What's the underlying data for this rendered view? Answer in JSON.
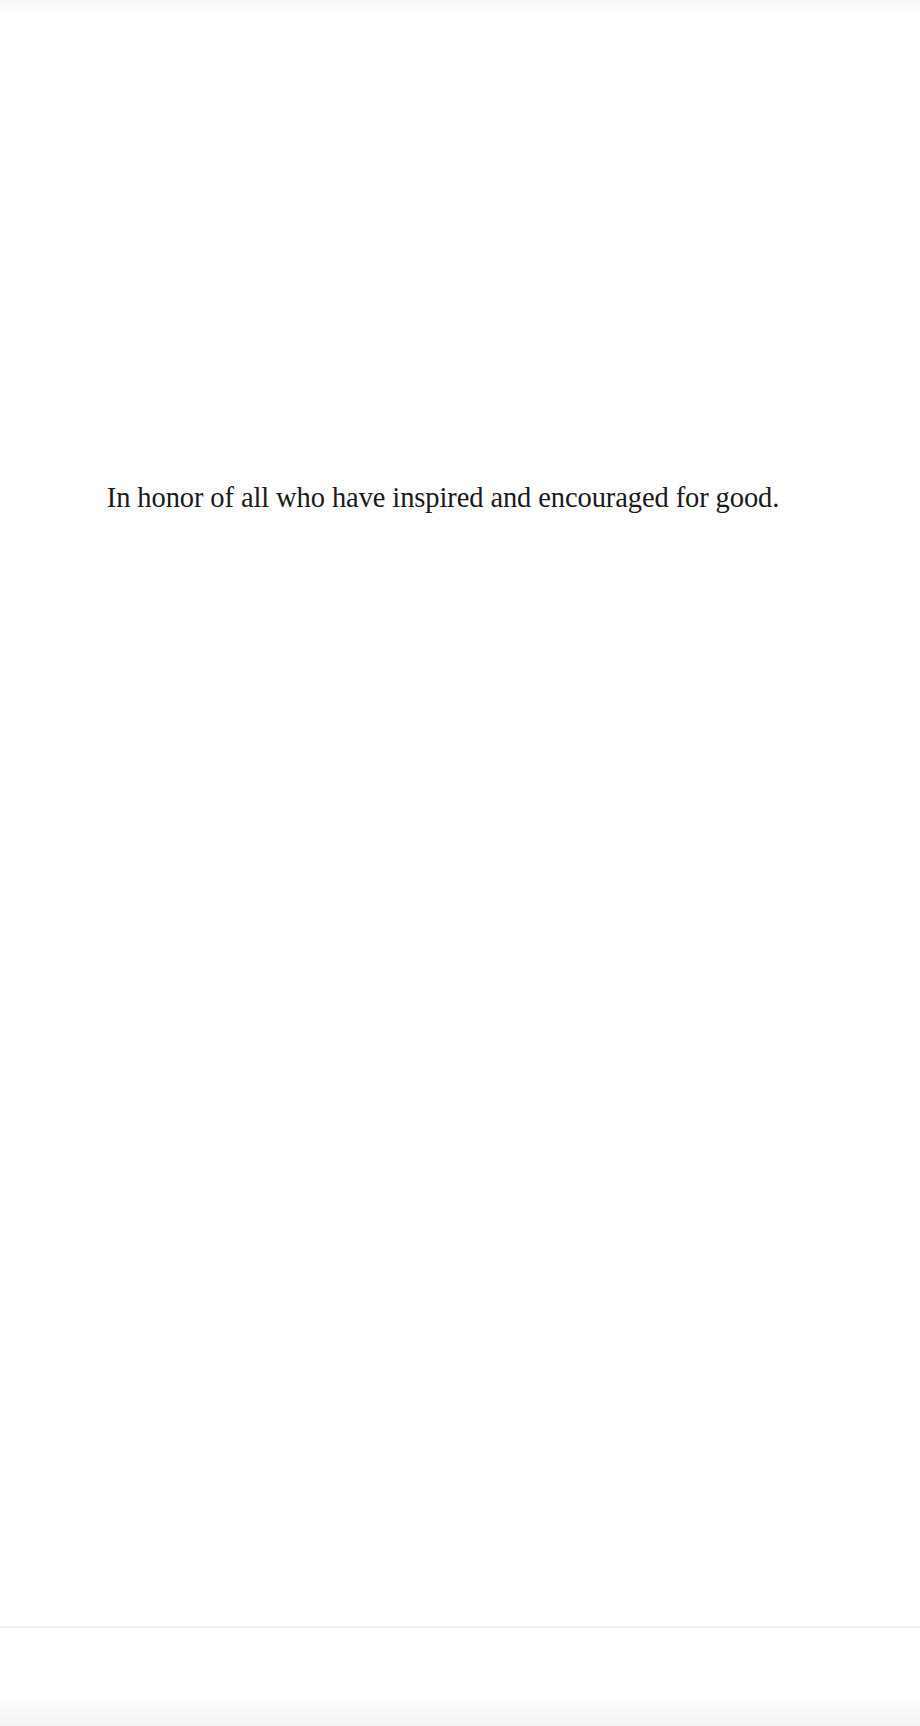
{
  "page": {
    "dedication": "In honor of all who have inspired and encouraged for good.",
    "background_color": "#ffffff",
    "text_color": "#1a1a1a"
  }
}
